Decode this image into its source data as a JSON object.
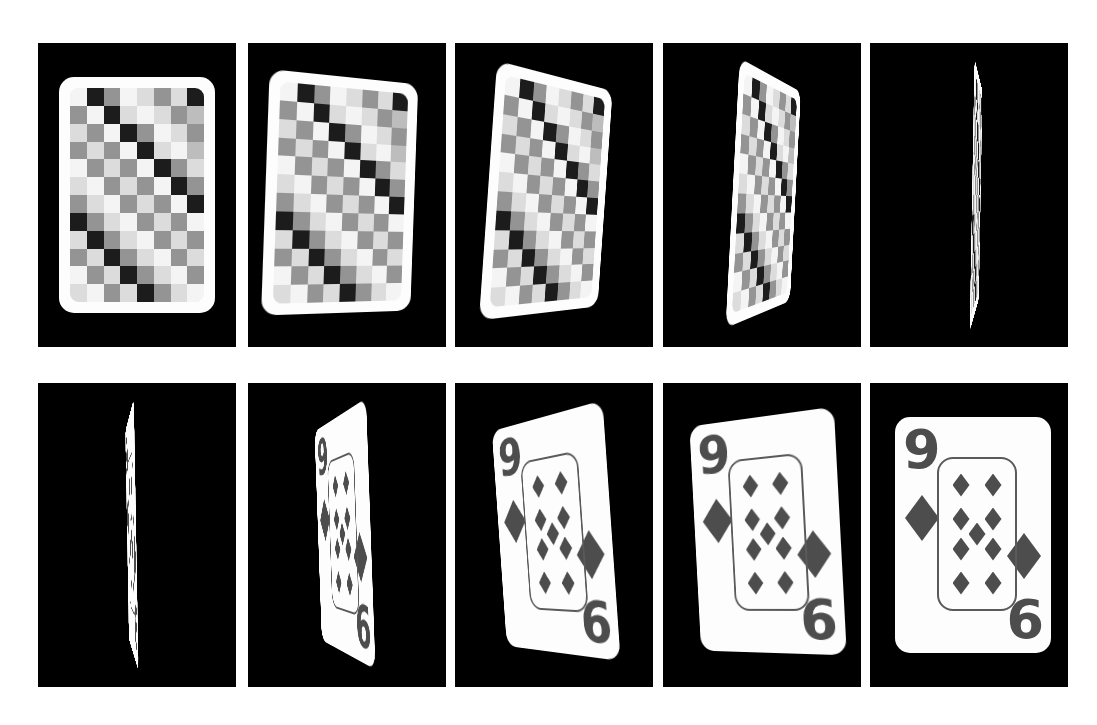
{
  "figure": {
    "background_color": "#ffffff",
    "panel_background_color": "#000000",
    "card_color": "#fdfdfd",
    "ink_color": "#4d4d4d",
    "rows": 2,
    "columns": 5
  },
  "card": {
    "rank_top_left": "9",
    "rank_bottom_right": "6",
    "suit": "diamond",
    "suit_symbol": "♦",
    "pip_count": 9,
    "large_pip_count": 2,
    "back_design": "checkerboard",
    "back_grid_columns": 8,
    "back_grid_rows": 12
  },
  "rows": [
    {
      "name": "card-back-row",
      "label": "back",
      "frames": [
        {
          "label": "frame-1",
          "angle": "0",
          "face": "back"
        },
        {
          "label": "frame-2",
          "angle": "18",
          "face": "back"
        },
        {
          "label": "frame-3",
          "angle": "42",
          "face": "back"
        },
        {
          "label": "frame-4",
          "angle": "66",
          "face": "back"
        },
        {
          "label": "frame-5",
          "angle": "86",
          "face": "back"
        }
      ]
    },
    {
      "name": "card-face-row",
      "label": "face",
      "frames": [
        {
          "label": "frame-6",
          "angle": "86",
          "face": "face"
        },
        {
          "label": "frame-7",
          "angle": "70",
          "face": "face"
        },
        {
          "label": "frame-8",
          "angle": "44",
          "face": "face"
        },
        {
          "label": "frame-9",
          "angle": "22",
          "face": "face"
        },
        {
          "label": "frame-10",
          "angle": "0",
          "face": "face"
        }
      ]
    }
  ],
  "back_palette": {
    "darkest": "#1c1c1c",
    "dark": "#3b3b3b",
    "mid_dark": "#6f6f6f",
    "mid": "#949494",
    "light": "#bdbdbd",
    "lighter": "#dcdcdc",
    "lightest": "#f4f4f4"
  },
  "back_pattern": [
    [
      "#f4f4f4",
      "#1c1c1c",
      "#949494",
      "#f4f4f4",
      "#dcdcdc",
      "#949494",
      "#dcdcdc",
      "#1c1c1c"
    ],
    [
      "#949494",
      "#f4f4f4",
      "#1c1c1c",
      "#dcdcdc",
      "#f4f4f4",
      "#dcdcdc",
      "#949494",
      "#bdbdbd"
    ],
    [
      "#dcdcdc",
      "#949494",
      "#f4f4f4",
      "#1c1c1c",
      "#949494",
      "#f4f4f4",
      "#dcdcdc",
      "#949494"
    ],
    [
      "#949494",
      "#dcdcdc",
      "#949494",
      "#f4f4f4",
      "#1c1c1c",
      "#dcdcdc",
      "#f4f4f4",
      "#bdbdbd"
    ],
    [
      "#f4f4f4",
      "#949494",
      "#dcdcdc",
      "#949494",
      "#f4f4f4",
      "#1c1c1c",
      "#949494",
      "#dcdcdc"
    ],
    [
      "#dcdcdc",
      "#f4f4f4",
      "#949494",
      "#dcdcdc",
      "#949494",
      "#f4f4f4",
      "#1c1c1c",
      "#949494"
    ],
    [
      "#949494",
      "#dcdcdc",
      "#f4f4f4",
      "#949494",
      "#dcdcdc",
      "#949494",
      "#f4f4f4",
      "#1c1c1c"
    ],
    [
      "#1c1c1c",
      "#949494",
      "#dcdcdc",
      "#f4f4f4",
      "#949494",
      "#dcdcdc",
      "#949494",
      "#f4f4f4"
    ],
    [
      "#dcdcdc",
      "#1c1c1c",
      "#949494",
      "#dcdcdc",
      "#f4f4f4",
      "#949494",
      "#dcdcdc",
      "#949494"
    ],
    [
      "#949494",
      "#dcdcdc",
      "#1c1c1c",
      "#949494",
      "#dcdcdc",
      "#f4f4f4",
      "#949494",
      "#dcdcdc"
    ],
    [
      "#f4f4f4",
      "#949494",
      "#dcdcdc",
      "#1c1c1c",
      "#949494",
      "#dcdcdc",
      "#f4f4f4",
      "#949494"
    ],
    [
      "#dcdcdc",
      "#f4f4f4",
      "#949494",
      "#dcdcdc",
      "#1c1c1c",
      "#949494",
      "#dcdcdc",
      "#f4f4f4"
    ]
  ],
  "pip_positions": [
    {
      "x": 22,
      "y": 26
    },
    {
      "x": 54,
      "y": 26
    },
    {
      "x": 22,
      "y": 60
    },
    {
      "x": 54,
      "y": 60
    },
    {
      "x": 38,
      "y": 75
    },
    {
      "x": 22,
      "y": 90
    },
    {
      "x": 54,
      "y": 90
    },
    {
      "x": 22,
      "y": 124
    },
    {
      "x": 54,
      "y": 124
    }
  ],
  "panel_geometry": {
    "row_tops": [
      43,
      383
    ],
    "panel_height": 304,
    "panel_width": 198,
    "col_lefts": [
      38,
      248,
      455,
      663,
      870
    ],
    "gap": 10
  }
}
